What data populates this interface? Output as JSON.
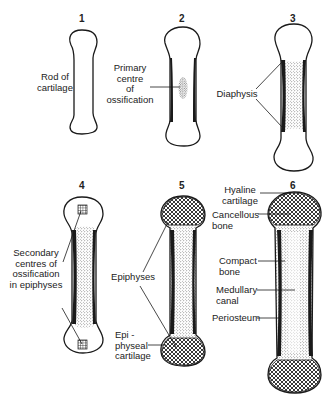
{
  "stages": [
    {
      "number": "1",
      "labels": [
        "Rod of cartilage"
      ]
    },
    {
      "number": "2",
      "labels": [
        "Primary centre of ossification"
      ]
    },
    {
      "number": "3",
      "labels": [
        "Diaphysis"
      ]
    },
    {
      "number": "4",
      "labels": [
        "Secondary centres of ossification in epiphyses"
      ]
    },
    {
      "number": "5",
      "labels": [
        "Epiphyses",
        "Epi-physeal cartilage"
      ]
    },
    {
      "number": "6",
      "labels": [
        "Hyaline cartilage",
        "Cancellous bone",
        "Compact bone",
        "Medullary canal",
        "Periosteum"
      ]
    }
  ],
  "text": {
    "n1": "1",
    "n2": "2",
    "n3": "3",
    "n4": "4",
    "n5": "5",
    "n6": "6",
    "rod": "Rod of\ncartilage",
    "primary": "Primary\ncentre\nof\nossification",
    "diaphysis": "Diaphysis",
    "secondary": "Secondary\ncentres of\nossification\nin epiphyses",
    "epiphyses": "Epiphyses",
    "epiphyseal": "Epi -\nphyseal\ncartilage",
    "hyaline": "Hyaline\ncartilage",
    "cancellous": "Cancellous\nbone",
    "compact": "Compact\nbone",
    "medullary": "Medullary\ncanal",
    "periosteum": "Periosteum"
  },
  "colors": {
    "ink": "#1a1a1a",
    "background": "#ffffff"
  }
}
